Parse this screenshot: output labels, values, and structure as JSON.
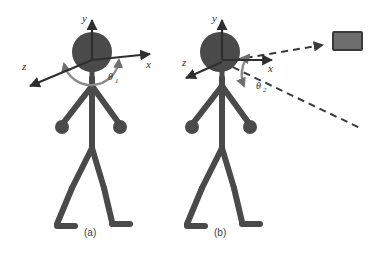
{
  "figure": {
    "background_color": "#ffffff",
    "body_color": "#4a4a4a",
    "axis_color": "#2f2f2f",
    "arc_color": "#6f6f6f",
    "target_fill": "#6e6e6e",
    "target_stroke": "#3a3a3a",
    "dashed_color": "#3a3a3a",
    "panels": [
      {
        "id": "panel-a",
        "caption": "(a)",
        "axes": [
          {
            "name": "y-axis",
            "label": "y",
            "direction": "up"
          },
          {
            "name": "x-axis",
            "label": "x",
            "direction": "right"
          },
          {
            "name": "z-axis",
            "label": "z",
            "direction": "down-left"
          }
        ],
        "angle": {
          "symbol": "θ",
          "subscript": "1",
          "name": "theta-1"
        },
        "has_target": false,
        "has_sight_lines": false
      },
      {
        "id": "panel-b",
        "caption": "(b)",
        "axes": [
          {
            "name": "y-axis",
            "label": "y",
            "direction": "up"
          },
          {
            "name": "x-axis",
            "label": "x",
            "direction": "right"
          },
          {
            "name": "z-axis",
            "label": "z",
            "direction": "down-left"
          }
        ],
        "angle": {
          "symbol": "θ",
          "subscript": "2",
          "name": "theta-2"
        },
        "has_target": true,
        "has_sight_lines": true,
        "target": {
          "name": "target-box",
          "shape": "rectangle"
        }
      }
    ]
  }
}
